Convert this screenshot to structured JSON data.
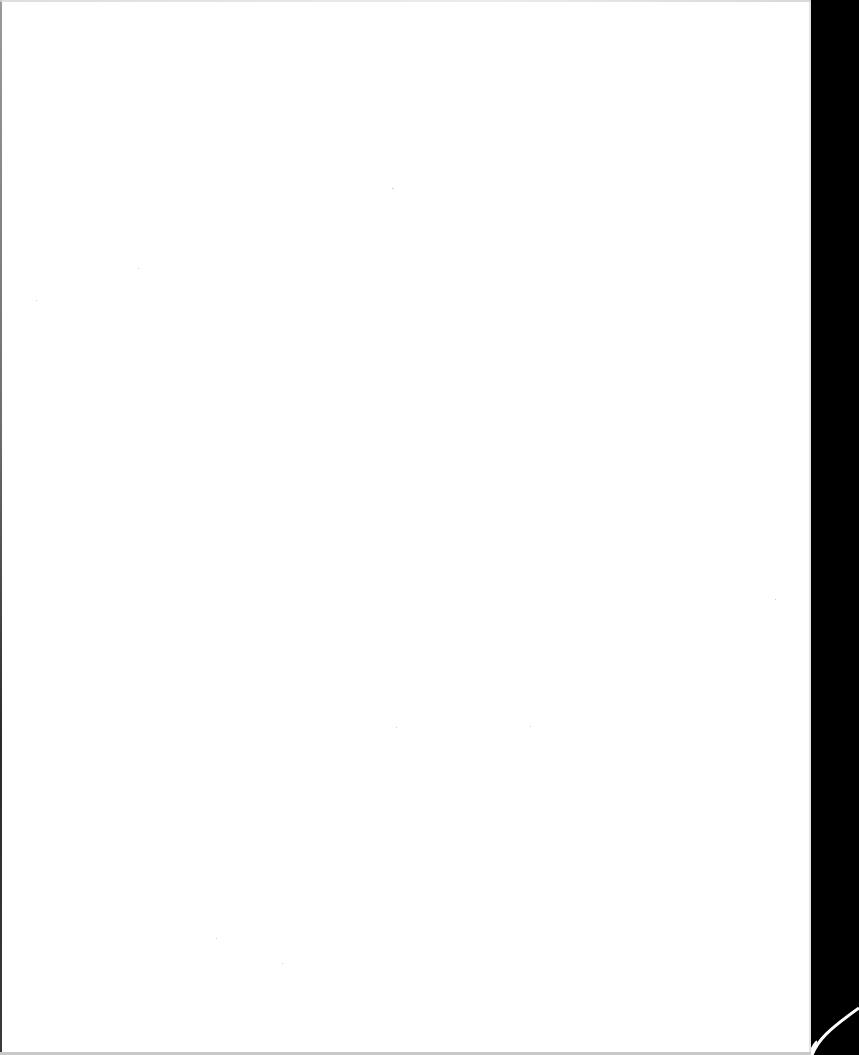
{
  "document": {
    "type": "blank-scanned-page",
    "text": "",
    "page_color": "#ffffff",
    "background_color": "#000000"
  },
  "colors": {
    "paper": "#ffffff",
    "scanner_bed": "#000000",
    "edge_shadow": "#6e6e6e",
    "bottom_edge": "#c8c8c8"
  }
}
